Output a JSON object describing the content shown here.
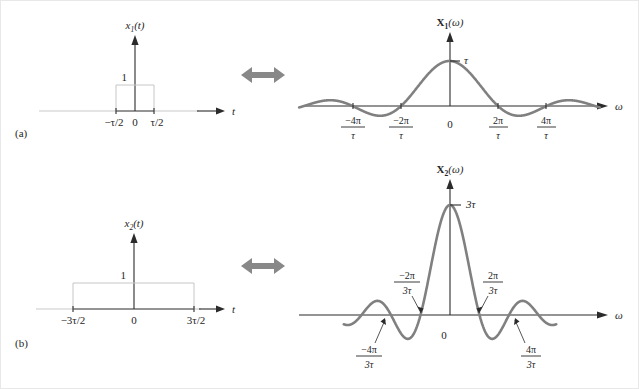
{
  "figure": {
    "panel_a_label": "(a)",
    "panel_b_label": "(b)",
    "relation_icon": "left-right-double-arrow"
  },
  "panel_a": {
    "time_plot": {
      "title": "x₁(t)",
      "title_base": "x",
      "title_sub": "1",
      "title_tail": "(t)",
      "x_axis_label": "t",
      "amplitude_label": "1",
      "origin_label": "0",
      "left_edge_label": "−τ/2",
      "right_edge_label": "τ/2"
    },
    "freq_plot": {
      "title_base": "X",
      "title_sub": "1",
      "title_tail": "(ω)",
      "x_axis_label": "ω",
      "peak_label": "τ",
      "origin_label": "0",
      "ticks": [
        {
          "num": "−4π",
          "den": "τ"
        },
        {
          "num": "−2π",
          "den": "τ"
        },
        {
          "num": "2π",
          "den": "τ"
        },
        {
          "num": "4π",
          "den": "τ"
        }
      ]
    }
  },
  "panel_b": {
    "time_plot": {
      "title_base": "x",
      "title_sub": "2",
      "title_tail": "(t)",
      "x_axis_label": "t",
      "amplitude_label": "1",
      "origin_label": "0",
      "left_edge_label": "−3τ/2",
      "right_edge_label": "3τ/2"
    },
    "freq_plot": {
      "title_base": "X",
      "title_sub": "2",
      "title_tail": "(ω)",
      "x_axis_label": "ω",
      "peak_label": "3τ",
      "origin_label": "0",
      "ticks_upper": [
        {
          "num": "−2π",
          "den": "3τ"
        },
        {
          "num": "2π",
          "den": "3τ"
        }
      ],
      "ticks_lower": [
        {
          "num": "−4π",
          "den": "3τ"
        },
        {
          "num": "4π",
          "den": "3τ"
        }
      ]
    }
  },
  "chart_data": [
    {
      "type": "line",
      "id": "x1-time",
      "title": "x₁(t)",
      "xlabel": "t",
      "ylabel": "",
      "description": "Rectangular pulse of unit amplitude and width tau centered at origin",
      "x": [
        -4,
        -0.5,
        -0.5,
        0.5,
        0.5,
        4
      ],
      "y": [
        0,
        0,
        1,
        1,
        0,
        0
      ],
      "xticks": [
        "−τ/2",
        "0",
        "τ/2"
      ],
      "yticks": [
        "1"
      ],
      "grid": false
    },
    {
      "type": "line",
      "id": "X1-freq",
      "title": "X₁(ω)",
      "xlabel": "ω",
      "ylabel": "",
      "description": "Sinc function tau*sinc(omega*tau/2); peak value tau at omega=0; zero crossings at multiples of 2pi/tau",
      "function": "tau*sin(omega*tau/2)/(omega*tau/2)",
      "peak_value": "τ",
      "xticks": [
        "−4π/τ",
        "−2π/τ",
        "0",
        "2π/τ",
        "4π/τ"
      ],
      "zero_crossings": [
        -4,
        -2,
        2,
        4
      ],
      "xlim": [
        -6.6,
        6.6
      ],
      "grid": false
    },
    {
      "type": "line",
      "id": "x2-time",
      "title": "x₂(t)",
      "xlabel": "t",
      "ylabel": "",
      "description": "Rectangular pulse of unit amplitude and width 3*tau centered at origin",
      "x": [
        -4,
        -1.5,
        -1.5,
        1.5,
        1.5,
        4
      ],
      "y": [
        0,
        0,
        1,
        1,
        0,
        0
      ],
      "xticks": [
        "−3τ/2",
        "0",
        "3τ/2"
      ],
      "yticks": [
        "1"
      ],
      "grid": false
    },
    {
      "type": "line",
      "id": "X2-freq",
      "title": "X₂(ω)",
      "xlabel": "ω",
      "ylabel": "",
      "description": "Sinc function 3*tau*sinc(3*omega*tau/2); peak value 3tau at omega=0; zero crossings at multiples of 2pi/(3tau)",
      "function": "3*tau*sin(3*omega*tau/2)/(3*omega*tau/2)",
      "peak_value": "3τ",
      "xticks": [
        "−4π/3τ",
        "−2π/3τ",
        "0",
        "2π/3τ",
        "4π/3τ"
      ],
      "zero_crossings": [
        -4,
        -2,
        2,
        4
      ],
      "xlim": [
        -6.6,
        6.6
      ],
      "grid": false
    }
  ],
  "colors": {
    "curve": "#808080",
    "axis": "#2b2b2b",
    "pulse_outline": "#c6c6c6",
    "arrow": "#888888",
    "background": "#ffffff",
    "border": "#e8e8e8"
  }
}
